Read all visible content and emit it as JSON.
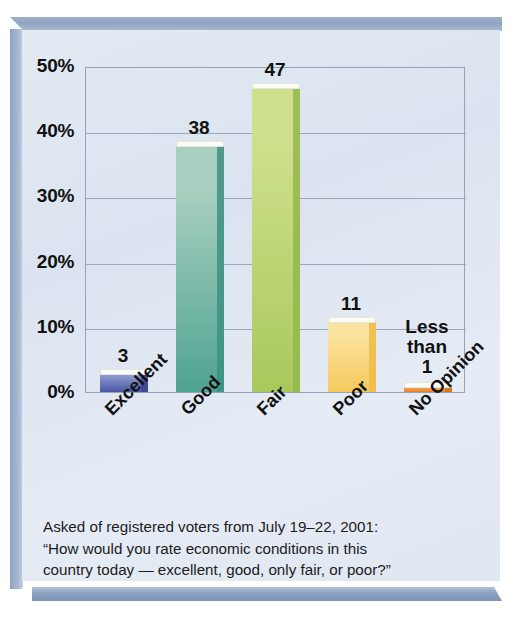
{
  "chart_data": {
    "type": "bar",
    "title": "",
    "subtitle": "",
    "xlabel": "",
    "ylabel": "",
    "ylim": [
      0,
      50
    ],
    "ytick_values": [
      0,
      10,
      20,
      30,
      40,
      50
    ],
    "ytick_labels": [
      "0%",
      "10%",
      "20%",
      "30%",
      "40%",
      "50%"
    ],
    "grid": true,
    "legend": "none",
    "categories": [
      "Excellent",
      "Good",
      "Fair",
      "Poor",
      "No Opinion"
    ],
    "values": [
      3,
      38,
      47,
      11,
      0.5
    ],
    "value_labels": [
      "3",
      "38",
      "47",
      "11",
      "Less\nthan\n1"
    ],
    "bar_colors": [
      "#5b6bb5",
      "#6fb3a4",
      "#b8d36a",
      "#f7d06a",
      "#ef8a2b"
    ]
  },
  "bars": [
    {
      "category": "Excellent",
      "value": 3,
      "label": "3",
      "label_lines": [
        "3"
      ],
      "color_light": "#8e99cf",
      "color_dark": "#4a57a3",
      "side_color": "#39478f"
    },
    {
      "category": "Good",
      "value": 38,
      "label": "38",
      "label_lines": [
        "38"
      ],
      "color_light": "#a8cfc0",
      "color_dark": "#4fa391",
      "side_color": "#3d9180"
    },
    {
      "category": "Fair",
      "value": 47,
      "label": "47",
      "label_lines": [
        "47"
      ],
      "color_light": "#cfe08c",
      "color_dark": "#a9c95c",
      "side_color": "#93b84c"
    },
    {
      "category": "Poor",
      "value": 11,
      "label": "11",
      "label_lines": [
        "11"
      ],
      "color_light": "#fbe3a0",
      "color_dark": "#f5c95c",
      "side_color": "#eebb45"
    },
    {
      "category": "No Opinion",
      "value": 0.5,
      "label": "Less than 1",
      "label_lines": [
        "Less",
        "than",
        "1"
      ],
      "color_light": "#f6b46b",
      "color_dark": "#ea7f1f",
      "side_color": "#d96f14"
    }
  ],
  "caption": {
    "line1": "Asked of registered voters from July 19–22, 2001:",
    "line2": "“How would you rate economic conditions in this",
    "line3": "country today — excellent, good, only fair, or poor?”"
  }
}
